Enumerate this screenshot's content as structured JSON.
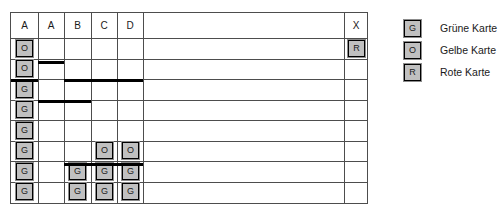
{
  "table": {
    "column_headers": [
      "A",
      "A",
      "B",
      "C",
      "D",
      "",
      "X"
    ],
    "column_edges": [
      0,
      27,
      53,
      80,
      106,
      132,
      333,
      357
    ],
    "header_height": 25,
    "row_count": 8,
    "row_top": 25,
    "row_height": 20.5,
    "cards": [
      {
        "column": 0,
        "row": 0,
        "label": "O"
      },
      {
        "column": 0,
        "row": 1,
        "label": "O"
      },
      {
        "column": 0,
        "row": 2,
        "label": "G"
      },
      {
        "column": 0,
        "row": 3,
        "label": "G"
      },
      {
        "column": 0,
        "row": 4,
        "label": "G"
      },
      {
        "column": 0,
        "row": 5,
        "label": "G"
      },
      {
        "column": 0,
        "row": 6,
        "label": "G"
      },
      {
        "column": 0,
        "row": 7,
        "label": "G"
      },
      {
        "column": 2,
        "row": 6,
        "label": "G"
      },
      {
        "column": 2,
        "row": 7,
        "label": "G"
      },
      {
        "column": 3,
        "row": 5,
        "label": "O"
      },
      {
        "column": 3,
        "row": 6,
        "label": "G"
      },
      {
        "column": 3,
        "row": 7,
        "label": "G"
      },
      {
        "column": 4,
        "row": 5,
        "label": "O"
      },
      {
        "column": 4,
        "row": 6,
        "label": "G"
      },
      {
        "column": 4,
        "row": 7,
        "label": "G"
      },
      {
        "column": 6,
        "row": 0,
        "label": "R"
      }
    ],
    "bars": [
      {
        "from_column": 1,
        "to_column": 1,
        "y": 48
      },
      {
        "from_column": 0,
        "to_column": 0,
        "y": 66
      },
      {
        "from_column": 2,
        "to_column": 4,
        "y": 66
      },
      {
        "from_column": 1,
        "to_column": 2,
        "y": 87
      },
      {
        "from_column": 2,
        "to_column": 2,
        "y": 150
      },
      {
        "from_column": 3,
        "to_column": 4,
        "y": 150
      }
    ]
  },
  "legend": {
    "entries": [
      {
        "chip": "G",
        "label": "Grüne Karte"
      },
      {
        "chip": "O",
        "label": "Gelbe Karte"
      },
      {
        "chip": "R",
        "label": "Rote Karte"
      }
    ]
  },
  "caption": {
    "text": ""
  }
}
